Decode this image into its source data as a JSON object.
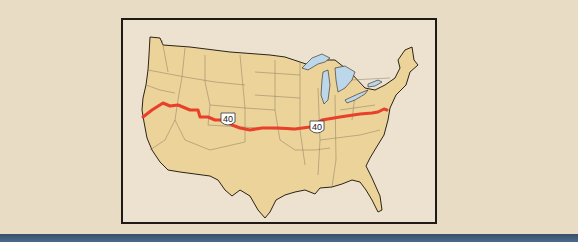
{
  "map": {
    "title": "",
    "region": "Contiguous United States",
    "route": {
      "name": "U.S. Route 40",
      "shield_labels": [
        "40",
        "40"
      ],
      "color": "#e8402a"
    },
    "colors": {
      "land": "#ecd39a",
      "water": "#bcd6ea",
      "background": "#e9dcc5",
      "border": "#1e1a16",
      "bottom_bar": "#3a4f6b"
    }
  }
}
